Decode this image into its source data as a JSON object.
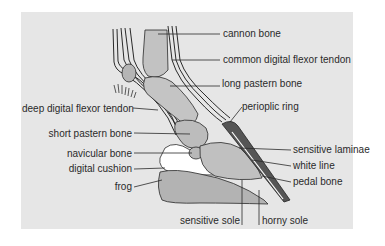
{
  "diagram": {
    "colors": {
      "panel": "#e6e6e6",
      "bone": "#bdbdbd",
      "outline": "#2a2a2a",
      "cushion": "#ffffff",
      "frog": "#b0b0b0",
      "wall": "#555555"
    },
    "labels": {
      "cannon_bone": "cannon bone",
      "common_digital_flexor_tendon": "common digital flexor tendon",
      "long_pastern_bone": "long pastern bone",
      "deep_digital_flexor_tendon": "deep digital flexor tendon",
      "perioplic_ring": "perioplic ring",
      "short_pastern_bone": "short pastern bone",
      "sensitive_laminae": "sensitive laminae",
      "navicular_bone": "navicular bone",
      "white_line": "white line",
      "digital_cushion": "digital cushion",
      "pedal_bone": "pedal bone",
      "frog": "frog",
      "sensitive_sole": "sensitive sole",
      "horny_sole": "horny sole"
    }
  }
}
